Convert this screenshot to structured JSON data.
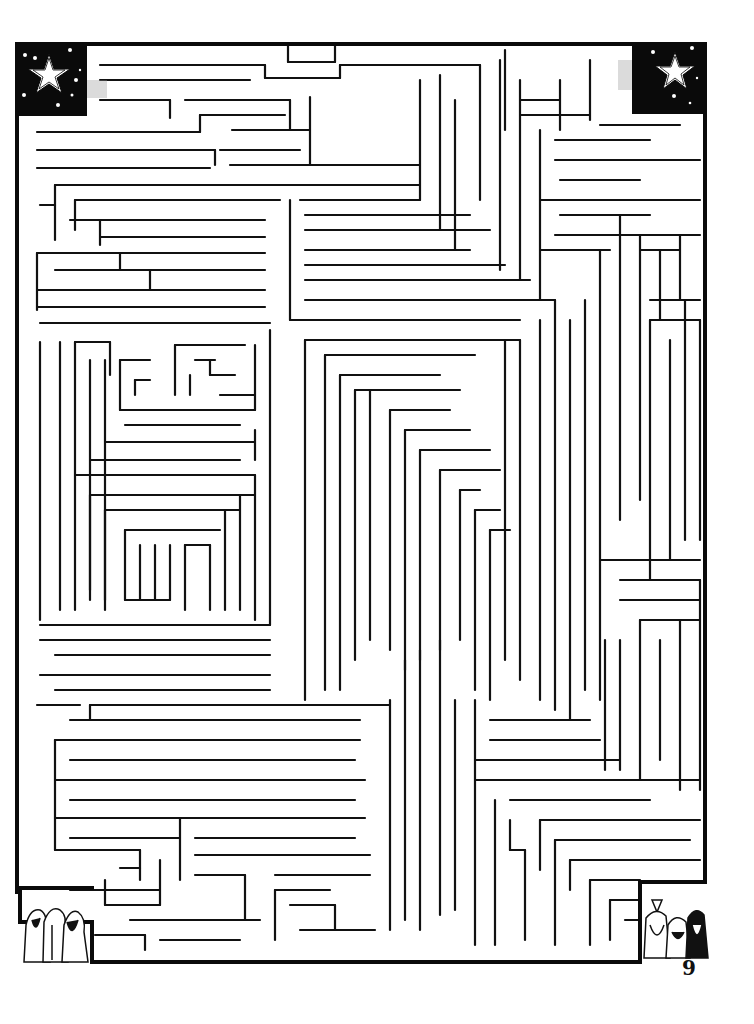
{
  "page": {
    "number": "9",
    "background": "#ffffff",
    "ink": "#111111"
  },
  "maze": {
    "border": [
      [
        17,
        44,
        705,
        44
      ],
      [
        705,
        44,
        705,
        882
      ],
      [
        705,
        882,
        640,
        882
      ],
      [
        640,
        882,
        640,
        962
      ],
      [
        640,
        962,
        92,
        962
      ],
      [
        92,
        962,
        92,
        922
      ],
      [
        92,
        922,
        20,
        922
      ],
      [
        20,
        922,
        20,
        888
      ],
      [
        20,
        888,
        92,
        888
      ],
      [
        17,
        44,
        17,
        892
      ]
    ],
    "walls": [
      [
        100,
        65,
        265,
        65
      ],
      [
        265,
        65,
        265,
        78
      ],
      [
        265,
        78,
        340,
        78
      ],
      [
        340,
        78,
        340,
        65
      ],
      [
        340,
        65,
        480,
        65
      ],
      [
        100,
        80,
        250,
        80
      ],
      [
        288,
        46,
        288,
        62
      ],
      [
        288,
        62,
        335,
        62
      ],
      [
        335,
        62,
        335,
        46
      ],
      [
        100,
        100,
        170,
        100
      ],
      [
        170,
        100,
        170,
        118
      ],
      [
        185,
        100,
        290,
        100
      ],
      [
        290,
        100,
        290,
        130
      ],
      [
        37,
        132,
        200,
        132
      ],
      [
        200,
        115,
        200,
        132
      ],
      [
        200,
        115,
        285,
        115
      ],
      [
        37,
        150,
        215,
        150
      ],
      [
        215,
        150,
        215,
        165
      ],
      [
        220,
        150,
        300,
        150
      ],
      [
        310,
        97,
        310,
        165
      ],
      [
        37,
        168,
        210,
        168
      ],
      [
        232,
        130,
        310,
        130
      ],
      [
        230,
        165,
        420,
        165
      ],
      [
        55,
        185,
        420,
        185
      ],
      [
        55,
        185,
        55,
        240
      ],
      [
        40,
        205,
        55,
        205
      ],
      [
        75,
        200,
        280,
        200
      ],
      [
        75,
        200,
        75,
        230
      ],
      [
        290,
        200,
        290,
        320
      ],
      [
        70,
        220,
        265,
        220
      ],
      [
        100,
        237,
        265,
        237
      ],
      [
        100,
        220,
        100,
        245
      ],
      [
        37,
        253,
        265,
        253
      ],
      [
        37,
        253,
        37,
        310
      ],
      [
        120,
        253,
        120,
        270
      ],
      [
        55,
        270,
        265,
        270
      ],
      [
        150,
        270,
        150,
        290
      ],
      [
        37,
        290,
        155,
        290
      ],
      [
        37,
        307,
        265,
        307
      ],
      [
        155,
        290,
        265,
        290
      ],
      [
        40,
        323,
        270,
        323
      ],
      [
        290,
        320,
        520,
        320
      ],
      [
        300,
        200,
        420,
        200
      ],
      [
        305,
        215,
        470,
        215
      ],
      [
        305,
        230,
        490,
        230
      ],
      [
        305,
        250,
        470,
        250
      ],
      [
        305,
        265,
        505,
        265
      ],
      [
        305,
        280,
        530,
        280
      ],
      [
        305,
        300,
        555,
        300
      ],
      [
        420,
        80,
        420,
        200
      ],
      [
        440,
        75,
        440,
        230
      ],
      [
        455,
        100,
        455,
        250
      ],
      [
        480,
        65,
        480,
        200
      ],
      [
        500,
        60,
        500,
        270
      ],
      [
        520,
        80,
        520,
        280
      ],
      [
        540,
        130,
        540,
        300
      ],
      [
        505,
        50,
        505,
        130
      ],
      [
        520,
        100,
        560,
        100
      ],
      [
        520,
        115,
        590,
        115
      ],
      [
        560,
        80,
        560,
        130
      ],
      [
        590,
        60,
        590,
        120
      ],
      [
        600,
        125,
        680,
        125
      ],
      [
        555,
        140,
        650,
        140
      ],
      [
        555,
        160,
        700,
        160
      ],
      [
        560,
        180,
        640,
        180
      ],
      [
        540,
        200,
        700,
        200
      ],
      [
        560,
        215,
        650,
        215
      ],
      [
        555,
        235,
        700,
        235
      ],
      [
        540,
        250,
        610,
        250
      ],
      [
        600,
        250,
        600,
        700
      ],
      [
        620,
        215,
        620,
        520
      ],
      [
        640,
        235,
        640,
        500
      ],
      [
        640,
        250,
        680,
        250
      ],
      [
        660,
        250,
        660,
        320
      ],
      [
        680,
        235,
        680,
        300
      ],
      [
        650,
        300,
        700,
        300
      ],
      [
        650,
        320,
        700,
        320
      ],
      [
        650,
        320,
        650,
        580
      ],
      [
        670,
        340,
        670,
        560
      ],
      [
        685,
        300,
        685,
        540
      ],
      [
        700,
        320,
        700,
        540
      ],
      [
        40,
        342,
        40,
        620
      ],
      [
        60,
        342,
        60,
        610
      ],
      [
        75,
        342,
        110,
        342
      ],
      [
        75,
        342,
        75,
        610
      ],
      [
        90,
        360,
        90,
        590
      ],
      [
        105,
        360,
        105,
        600
      ],
      [
        110,
        342,
        110,
        375
      ],
      [
        120,
        360,
        150,
        360
      ],
      [
        120,
        360,
        120,
        410
      ],
      [
        135,
        380,
        150,
        380
      ],
      [
        135,
        380,
        135,
        395
      ],
      [
        175,
        345,
        175,
        395
      ],
      [
        175,
        345,
        245,
        345
      ],
      [
        195,
        360,
        215,
        360
      ],
      [
        210,
        360,
        210,
        375
      ],
      [
        210,
        375,
        235,
        375
      ],
      [
        190,
        375,
        190,
        395
      ],
      [
        220,
        395,
        255,
        395
      ],
      [
        120,
        410,
        255,
        410
      ],
      [
        255,
        345,
        255,
        410
      ],
      [
        125,
        425,
        240,
        425
      ],
      [
        105,
        442,
        255,
        442
      ],
      [
        255,
        430,
        255,
        460
      ],
      [
        90,
        460,
        240,
        460
      ],
      [
        75,
        475,
        255,
        475
      ],
      [
        90,
        495,
        255,
        495
      ],
      [
        90,
        495,
        90,
        600
      ],
      [
        105,
        510,
        240,
        510
      ],
      [
        105,
        510,
        105,
        610
      ],
      [
        125,
        530,
        220,
        530
      ],
      [
        125,
        530,
        125,
        600
      ],
      [
        140,
        545,
        140,
        600
      ],
      [
        155,
        545,
        155,
        600
      ],
      [
        170,
        545,
        170,
        600
      ],
      [
        185,
        545,
        210,
        545
      ],
      [
        185,
        545,
        185,
        610
      ],
      [
        210,
        545,
        210,
        610
      ],
      [
        125,
        600,
        170,
        600
      ],
      [
        225,
        510,
        225,
        610
      ],
      [
        240,
        495,
        240,
        610
      ],
      [
        255,
        475,
        255,
        620
      ],
      [
        270,
        330,
        270,
        625
      ],
      [
        40,
        625,
        270,
        625
      ],
      [
        305,
        340,
        520,
        340
      ],
      [
        305,
        340,
        305,
        700
      ],
      [
        325,
        355,
        475,
        355
      ],
      [
        325,
        355,
        325,
        690
      ],
      [
        340,
        375,
        440,
        375
      ],
      [
        340,
        375,
        340,
        690
      ],
      [
        355,
        390,
        460,
        390
      ],
      [
        355,
        390,
        355,
        660
      ],
      [
        370,
        390,
        370,
        640
      ],
      [
        390,
        410,
        450,
        410
      ],
      [
        390,
        410,
        390,
        650
      ],
      [
        405,
        430,
        470,
        430
      ],
      [
        405,
        430,
        405,
        670
      ],
      [
        420,
        450,
        490,
        450
      ],
      [
        420,
        450,
        420,
        660
      ],
      [
        440,
        470,
        500,
        470
      ],
      [
        440,
        470,
        440,
        650
      ],
      [
        460,
        490,
        480,
        490
      ],
      [
        460,
        490,
        460,
        640
      ],
      [
        475,
        510,
        500,
        510
      ],
      [
        475,
        510,
        475,
        690
      ],
      [
        490,
        530,
        510,
        530
      ],
      [
        490,
        530,
        490,
        700
      ],
      [
        505,
        340,
        505,
        660
      ],
      [
        520,
        340,
        520,
        680
      ],
      [
        540,
        320,
        540,
        700
      ],
      [
        555,
        300,
        555,
        710
      ],
      [
        570,
        320,
        570,
        720
      ],
      [
        585,
        300,
        585,
        690
      ],
      [
        40,
        640,
        270,
        640
      ],
      [
        55,
        655,
        270,
        655
      ],
      [
        40,
        675,
        270,
        675
      ],
      [
        55,
        690,
        270,
        690
      ],
      [
        37,
        705,
        80,
        705
      ],
      [
        90,
        705,
        390,
        705
      ],
      [
        90,
        705,
        90,
        720
      ],
      [
        70,
        720,
        360,
        720
      ],
      [
        55,
        740,
        70,
        740
      ],
      [
        55,
        740,
        55,
        850
      ],
      [
        70,
        740,
        360,
        740
      ],
      [
        70,
        760,
        355,
        760
      ],
      [
        55,
        780,
        365,
        780
      ],
      [
        70,
        800,
        355,
        800
      ],
      [
        55,
        818,
        365,
        818
      ],
      [
        70,
        838,
        180,
        838
      ],
      [
        180,
        818,
        180,
        880
      ],
      [
        195,
        838,
        355,
        838
      ],
      [
        195,
        855,
        370,
        855
      ],
      [
        55,
        850,
        140,
        850
      ],
      [
        140,
        850,
        140,
        880
      ],
      [
        120,
        868,
        140,
        868
      ],
      [
        70,
        890,
        160,
        890
      ],
      [
        160,
        860,
        160,
        905
      ],
      [
        105,
        905,
        160,
        905
      ],
      [
        105,
        880,
        105,
        905
      ],
      [
        195,
        875,
        245,
        875
      ],
      [
        245,
        875,
        245,
        920
      ],
      [
        130,
        920,
        260,
        920
      ],
      [
        275,
        875,
        370,
        875
      ],
      [
        275,
        890,
        330,
        890
      ],
      [
        275,
        890,
        275,
        940
      ],
      [
        290,
        905,
        335,
        905
      ],
      [
        335,
        905,
        335,
        930
      ],
      [
        95,
        935,
        145,
        935
      ],
      [
        145,
        935,
        145,
        950
      ],
      [
        160,
        940,
        240,
        940
      ],
      [
        300,
        930,
        375,
        930
      ],
      [
        390,
        700,
        390,
        930
      ],
      [
        405,
        660,
        405,
        920
      ],
      [
        420,
        650,
        420,
        930
      ],
      [
        440,
        640,
        440,
        915
      ],
      [
        455,
        700,
        455,
        910
      ],
      [
        475,
        700,
        475,
        945
      ],
      [
        490,
        720,
        590,
        720
      ],
      [
        490,
        740,
        600,
        740
      ],
      [
        475,
        760,
        620,
        760
      ],
      [
        475,
        780,
        700,
        780
      ],
      [
        495,
        800,
        495,
        945
      ],
      [
        510,
        800,
        650,
        800
      ],
      [
        510,
        820,
        510,
        850
      ],
      [
        510,
        850,
        525,
        850
      ],
      [
        525,
        850,
        525,
        940
      ],
      [
        540,
        820,
        700,
        820
      ],
      [
        540,
        820,
        540,
        870
      ],
      [
        555,
        840,
        690,
        840
      ],
      [
        555,
        840,
        555,
        945
      ],
      [
        570,
        860,
        700,
        860
      ],
      [
        570,
        860,
        570,
        890
      ],
      [
        590,
        880,
        640,
        880
      ],
      [
        590,
        880,
        590,
        945
      ],
      [
        610,
        900,
        640,
        900
      ],
      [
        610,
        900,
        610,
        940
      ],
      [
        625,
        920,
        640,
        920
      ],
      [
        600,
        560,
        700,
        560
      ],
      [
        620,
        580,
        700,
        580
      ],
      [
        620,
        600,
        700,
        600
      ],
      [
        640,
        620,
        700,
        620
      ],
      [
        640,
        620,
        640,
        780
      ],
      [
        660,
        640,
        660,
        760
      ],
      [
        680,
        620,
        680,
        790
      ],
      [
        700,
        580,
        700,
        790
      ],
      [
        605,
        640,
        605,
        770
      ],
      [
        620,
        640,
        620,
        770
      ]
    ]
  },
  "decorations": {
    "start_flag": {
      "label": "star-night-corner",
      "x": 17,
      "y": 44,
      "w": 70,
      "h": 72
    },
    "finish_flag": {
      "label": "star-night-corner",
      "x": 632,
      "y": 44,
      "w": 73,
      "h": 70
    },
    "wise_men_left": {
      "label": "three-wise-men",
      "x": 20,
      "y": 903,
      "w": 70,
      "h": 62
    },
    "wise_men_right": {
      "label": "three-wise-men",
      "x": 640,
      "y": 893,
      "w": 72,
      "h": 66
    }
  }
}
